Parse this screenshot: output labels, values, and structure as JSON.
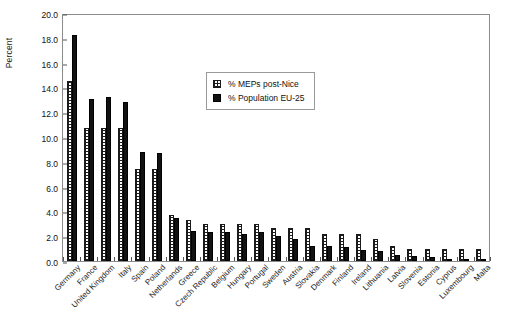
{
  "chart_data": {
    "type": "bar",
    "title": "",
    "xlabel": "",
    "ylabel": "Percent",
    "ylim": [
      0,
      20
    ],
    "ytick_step": 2,
    "ytick_labels": [
      "0.0",
      "2.0",
      "4.0",
      "6.0",
      "8.0",
      "10.0",
      "12.0",
      "14.0",
      "16.0",
      "18.0",
      "20.0"
    ],
    "grid": false,
    "legend_position": "upper-center",
    "categories": [
      "Germany",
      "France",
      "United Kingdom",
      "Italy",
      "Spain",
      "Poland",
      "Netherlands",
      "Greece",
      "Czech Republic",
      "Belgium",
      "Hungary",
      "Portugal",
      "Sweden",
      "Austria",
      "Slovakia",
      "Denmark",
      "Finland",
      "Ireland",
      "Lithuania",
      "Latvia",
      "Slovenia",
      "Estonia",
      "Cyprus",
      "Luxembourg",
      "Malta"
    ],
    "series": [
      {
        "name": "% MEPs post-Nice",
        "values": [
          14.5,
          10.7,
          10.7,
          10.7,
          7.4,
          7.4,
          3.7,
          3.3,
          3.0,
          3.0,
          3.0,
          3.0,
          2.7,
          2.7,
          2.7,
          2.2,
          2.2,
          2.2,
          1.8,
          1.2,
          1.0,
          1.0,
          1.0,
          1.0,
          1.0
        ]
      },
      {
        "name": "% Population EU-25",
        "values": [
          18.2,
          13.1,
          13.2,
          12.8,
          8.8,
          8.7,
          3.5,
          2.4,
          2.3,
          2.3,
          2.2,
          2.3,
          2.0,
          1.8,
          1.2,
          1.2,
          1.1,
          0.9,
          0.8,
          0.5,
          0.4,
          0.3,
          0.2,
          0.1,
          0.1
        ]
      }
    ],
    "colors": {
      "meps": "#ffffff",
      "population": "#121212",
      "frame": "#8c8c8c",
      "text": "#111111"
    }
  },
  "legend": {
    "entries": [
      {
        "label": "% MEPs post-Nice",
        "key": "meps"
      },
      {
        "label": "% Population EU-25",
        "key": "pop"
      }
    ]
  }
}
